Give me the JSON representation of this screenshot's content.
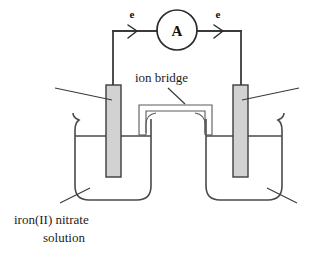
{
  "diagram": {
    "type": "science-diagram",
    "background_color": "#ffffff",
    "line_color": "#4a4a4a",
    "electrode_fill": "#d2d2d2",
    "labels": {
      "meter": "A",
      "electron_left": "e",
      "electron_right": "e",
      "ion_bridge": "ion bridge",
      "solution_line1": "iron(II) nitrate",
      "solution_line2": "solution"
    },
    "components": [
      {
        "name": "ammeter",
        "label": "A"
      },
      {
        "name": "left-electrode",
        "label": ""
      },
      {
        "name": "right-electrode",
        "label": ""
      },
      {
        "name": "left-beaker",
        "label": ""
      },
      {
        "name": "right-beaker",
        "label": ""
      },
      {
        "name": "ion-bridge",
        "label": "ion bridge"
      }
    ]
  }
}
